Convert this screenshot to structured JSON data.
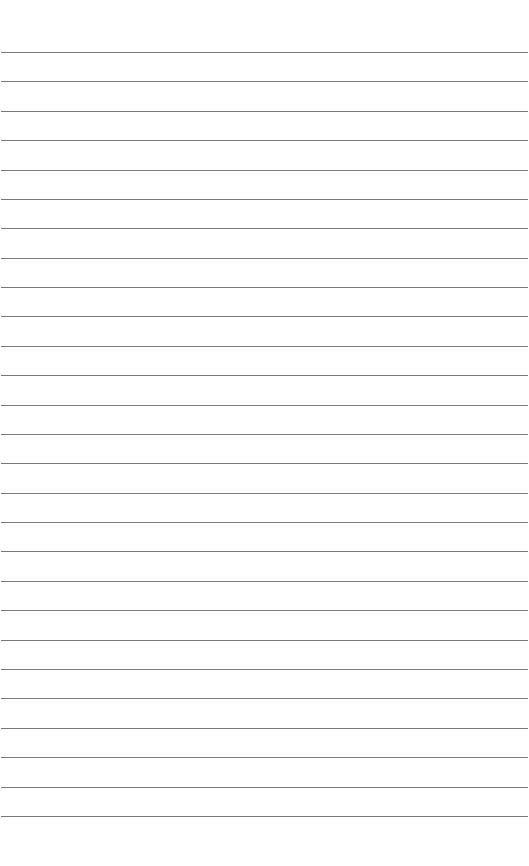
{
  "page": {
    "type": "lined-paper",
    "background_color": "#ffffff",
    "line_color": "#7a7a7a",
    "line_count": 27,
    "first_line_y": 52,
    "line_spacing": 29.38,
    "line_left": 1,
    "line_right": 528
  }
}
